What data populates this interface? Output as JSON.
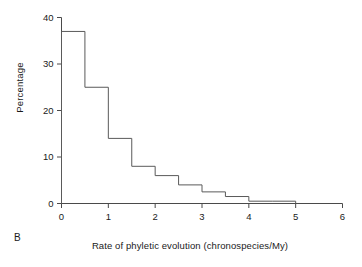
{
  "figure": {
    "panel_label": "B",
    "background_color": "#ffffff",
    "line_color": "#5a5a5a",
    "text_color": "#1a1a1a"
  },
  "chart_data": {
    "type": "bar",
    "render_style": "step-histogram-outline",
    "title": "",
    "subtitle": "",
    "xlabel": "Rate of phyletic evolution (chronospecies/My)",
    "ylabel": "Percentage",
    "xlim": [
      0,
      6
    ],
    "ylim": [
      0,
      40
    ],
    "xticks": [
      0,
      1,
      2,
      3,
      4,
      5,
      6
    ],
    "xtick_labels": [
      "0",
      "1",
      "2",
      "3",
      "4",
      "5",
      "6"
    ],
    "yticks": [
      0,
      10,
      20,
      30,
      40
    ],
    "ytick_labels": [
      "0",
      "10",
      "20",
      "30",
      "40"
    ],
    "grid": false,
    "legend": null,
    "bin_width": 0.5,
    "bin_edges": [
      0,
      0.5,
      1,
      1.5,
      2,
      2.5,
      3,
      3.5,
      4,
      4.5,
      5
    ],
    "categories": [
      "0-0.5",
      "0.5-1",
      "1-1.5",
      "1.5-2",
      "2-2.5",
      "2.5-3",
      "3-3.5",
      "3.5-4",
      "4-4.5",
      "4.5-5"
    ],
    "values": [
      37,
      25,
      14,
      8,
      6,
      4,
      2.5,
      1.5,
      0.5,
      0.5
    ],
    "annotations": []
  }
}
